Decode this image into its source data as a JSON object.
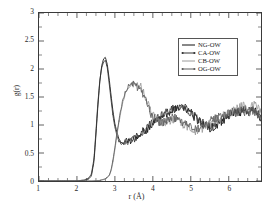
{
  "chart_data": {
    "type": "line",
    "title": "",
    "xlabel": "r (Å)",
    "ylabel": "g(r)",
    "xlim": [
      1,
      6.85
    ],
    "ylim": [
      0,
      3
    ],
    "xticks": [
      1,
      2,
      3,
      4,
      5,
      6
    ],
    "xticklabels": [
      "1",
      "2",
      "3",
      "4",
      "5",
      "6"
    ],
    "yticks": [
      0,
      0.5,
      1,
      1.5,
      2,
      2.5,
      3
    ],
    "yticklabels": [
      "0",
      "0.5",
      "1",
      "1.5",
      "2",
      "2.5",
      "3"
    ],
    "xminor_step": 0.25,
    "yminor_step": 0.25,
    "grid": false,
    "legend_position": "upper right",
    "series": [
      {
        "name": "NG-OW",
        "color": "#111111",
        "style": "solid",
        "x": [
          1.0,
          1.5,
          2.0,
          2.2,
          2.3,
          2.38,
          2.45,
          2.5,
          2.55,
          2.6,
          2.65,
          2.7,
          2.75,
          2.8,
          2.85,
          2.9,
          2.95,
          3.0,
          3.05,
          3.1,
          3.15,
          3.2,
          3.25,
          3.3,
          3.35,
          3.4,
          3.45,
          3.5,
          3.55,
          3.6,
          3.65,
          3.7,
          3.75,
          3.8,
          3.85,
          3.9,
          3.95,
          4.0,
          4.1,
          4.2,
          4.3,
          4.4,
          4.5,
          4.6,
          4.7,
          4.8,
          4.9,
          5.0,
          5.1,
          5.2,
          5.3,
          5.4,
          5.5,
          5.6,
          5.7,
          5.8,
          5.9,
          6.0,
          6.1,
          6.2,
          6.3,
          6.4,
          6.5,
          6.6,
          6.7,
          6.8,
          6.85
        ],
        "y": [
          0,
          0,
          0,
          0.01,
          0.03,
          0.09,
          0.35,
          0.82,
          1.32,
          1.76,
          2.05,
          2.18,
          2.21,
          2.08,
          1.82,
          1.52,
          1.24,
          1.02,
          0.88,
          0.76,
          0.7,
          0.68,
          0.7,
          0.73,
          0.72,
          0.7,
          0.73,
          0.78,
          0.76,
          0.8,
          0.85,
          0.83,
          0.88,
          0.92,
          0.9,
          0.95,
          1.0,
          1.02,
          1.08,
          1.12,
          1.18,
          1.22,
          1.25,
          1.28,
          1.27,
          1.3,
          1.26,
          1.2,
          1.14,
          1.08,
          1.02,
          0.98,
          0.95,
          0.97,
          1.0,
          1.05,
          1.1,
          1.16,
          1.2,
          1.24,
          1.22,
          1.26,
          1.23,
          1.28,
          1.24,
          1.18,
          1.1
        ]
      },
      {
        "name": "CA-OW",
        "color": "#333333",
        "style": "solid-marker",
        "x": [
          1.0,
          1.5,
          2.0,
          2.2,
          2.3,
          2.38,
          2.45,
          2.5,
          2.55,
          2.6,
          2.65,
          2.7,
          2.75,
          2.8,
          2.85,
          2.9,
          2.95,
          3.0,
          3.05,
          3.1,
          3.15,
          3.2,
          3.25,
          3.3,
          3.35,
          3.4,
          3.45,
          3.5,
          3.55,
          3.6,
          3.65,
          3.7,
          3.75,
          3.8,
          3.85,
          3.9,
          3.95,
          4.0,
          4.1,
          4.2,
          4.3,
          4.4,
          4.5,
          4.6,
          4.7,
          4.8,
          4.9,
          5.0,
          5.1,
          5.2,
          5.3,
          5.4,
          5.5,
          5.6,
          5.7,
          5.8,
          5.9,
          6.0,
          6.1,
          6.2,
          6.3,
          6.4,
          6.5,
          6.6,
          6.7,
          6.8,
          6.85
        ],
        "y": [
          0,
          0,
          0,
          0.02,
          0.05,
          0.12,
          0.4,
          0.88,
          1.38,
          1.78,
          2.02,
          2.12,
          2.16,
          2.02,
          1.74,
          1.44,
          1.16,
          0.96,
          0.82,
          0.72,
          0.68,
          0.66,
          0.68,
          0.7,
          0.69,
          0.72,
          0.75,
          0.74,
          0.78,
          0.82,
          0.8,
          0.86,
          0.9,
          0.88,
          0.94,
          0.98,
          1.02,
          1.05,
          1.1,
          1.15,
          1.2,
          1.24,
          1.28,
          1.3,
          1.29,
          1.32,
          1.28,
          1.22,
          1.16,
          1.1,
          1.04,
          1.0,
          0.96,
          0.99,
          1.03,
          1.08,
          1.12,
          1.18,
          1.22,
          1.26,
          1.24,
          1.28,
          1.25,
          1.3,
          1.26,
          1.2,
          1.14
        ]
      },
      {
        "name": "CB-OW",
        "color": "#9a9a9a",
        "style": "solid",
        "x": [
          1.0,
          1.5,
          2.0,
          2.4,
          2.6,
          2.75,
          2.85,
          2.9,
          2.95,
          3.0,
          3.05,
          3.1,
          3.15,
          3.2,
          3.25,
          3.3,
          3.35,
          3.4,
          3.45,
          3.5,
          3.55,
          3.6,
          3.65,
          3.7,
          3.75,
          3.8,
          3.85,
          3.9,
          3.95,
          4.0,
          4.1,
          4.2,
          4.3,
          4.4,
          4.5,
          4.6,
          4.7,
          4.8,
          4.9,
          5.0,
          5.1,
          5.2,
          5.3,
          5.4,
          5.5,
          5.6,
          5.7,
          5.8,
          5.9,
          6.0,
          6.1,
          6.2,
          6.3,
          6.4,
          6.5,
          6.6,
          6.7,
          6.8,
          6.85
        ],
        "y": [
          0,
          0,
          0,
          0,
          0.01,
          0.03,
          0.09,
          0.18,
          0.34,
          0.56,
          0.8,
          1.02,
          1.22,
          1.38,
          1.5,
          1.6,
          1.66,
          1.7,
          1.74,
          1.72,
          1.76,
          1.74,
          1.7,
          1.66,
          1.6,
          1.52,
          1.42,
          1.32,
          1.24,
          1.18,
          1.1,
          1.05,
          1.02,
          1.06,
          1.1,
          1.08,
          1.04,
          1.0,
          0.96,
          0.92,
          0.88,
          0.9,
          0.94,
          0.98,
          1.02,
          1.06,
          1.1,
          1.14,
          1.18,
          1.2,
          1.24,
          1.28,
          1.32,
          1.36,
          1.3,
          1.34,
          1.38,
          1.3,
          1.22
        ]
      },
      {
        "name": "OG-OW",
        "color": "#5c5c5c",
        "style": "solid-marker",
        "x": [
          1.0,
          1.5,
          2.0,
          2.4,
          2.6,
          2.75,
          2.85,
          2.9,
          2.95,
          3.0,
          3.05,
          3.1,
          3.15,
          3.2,
          3.25,
          3.3,
          3.35,
          3.4,
          3.45,
          3.5,
          3.55,
          3.6,
          3.65,
          3.7,
          3.75,
          3.8,
          3.85,
          3.9,
          3.95,
          4.0,
          4.1,
          4.2,
          4.3,
          4.4,
          4.5,
          4.6,
          4.7,
          4.8,
          4.9,
          5.0,
          5.1,
          5.2,
          5.3,
          5.4,
          5.5,
          5.6,
          5.7,
          5.8,
          5.9,
          6.0,
          6.1,
          6.2,
          6.3,
          6.4,
          6.5,
          6.6,
          6.7,
          6.8,
          6.85
        ],
        "y": [
          0,
          0,
          0,
          0,
          0.01,
          0.04,
          0.1,
          0.2,
          0.38,
          0.6,
          0.84,
          1.06,
          1.26,
          1.42,
          1.54,
          1.62,
          1.68,
          1.74,
          1.7,
          1.76,
          1.72,
          1.68,
          1.64,
          1.6,
          1.54,
          1.46,
          1.36,
          1.28,
          1.2,
          1.14,
          1.08,
          1.04,
          1.06,
          1.1,
          1.14,
          1.12,
          1.08,
          1.04,
          1.0,
          0.96,
          0.92,
          0.94,
          0.98,
          1.02,
          1.06,
          1.1,
          1.14,
          1.18,
          1.16,
          1.22,
          1.26,
          1.22,
          1.28,
          1.24,
          1.2,
          1.26,
          1.22,
          1.16,
          1.08
        ]
      }
    ],
    "noise": {
      "start_x": 3.0,
      "amplitude": 0.075,
      "step": 0.018
    }
  },
  "legend": {
    "items": [
      {
        "label": "NG-OW"
      },
      {
        "label": "CA-OW"
      },
      {
        "label": "CB-OW"
      },
      {
        "label": "OG-OW"
      }
    ]
  }
}
